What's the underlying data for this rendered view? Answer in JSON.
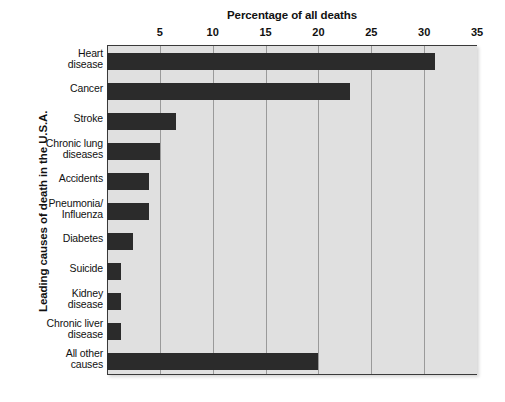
{
  "chart_data": {
    "type": "bar",
    "orientation": "horizontal",
    "title": "Percentage of all deaths",
    "xlabel": "Percentage of all deaths",
    "ylabel": "Leading causes of death in the U.S.A.",
    "xlim": [
      0,
      35
    ],
    "xticks": [
      0,
      5,
      10,
      15,
      20,
      25,
      30,
      35
    ],
    "xtick_labels": [
      "",
      "5",
      "10",
      "15",
      "20",
      "25",
      "30",
      "35"
    ],
    "grid": "vertical",
    "legend": "none",
    "bar_color": "#2b2b2b",
    "plot_background": "#e0e0e0",
    "categories": [
      "Heart disease",
      "Cancer",
      "Stroke",
      "Chronic lung diseases",
      "Accidents",
      "Pneumonia/ Influenza",
      "Diabetes",
      "Suicide",
      "Kidney disease",
      "Chronic liver disease",
      "All other causes"
    ],
    "category_lines": [
      [
        "Heart",
        "disease"
      ],
      [
        "Cancer"
      ],
      [
        "Stroke"
      ],
      [
        "Chronic lung",
        "diseases"
      ],
      [
        "Accidents"
      ],
      [
        "Pneumonia/",
        "Influenza"
      ],
      [
        "Diabetes"
      ],
      [
        "Suicide"
      ],
      [
        "Kidney",
        "disease"
      ],
      [
        "Chronic liver",
        "disease"
      ],
      [
        "All other",
        "causes"
      ]
    ],
    "values": [
      31,
      23,
      6.5,
      5,
      4,
      4,
      2.5,
      1.3,
      1.3,
      1.3,
      20
    ]
  }
}
